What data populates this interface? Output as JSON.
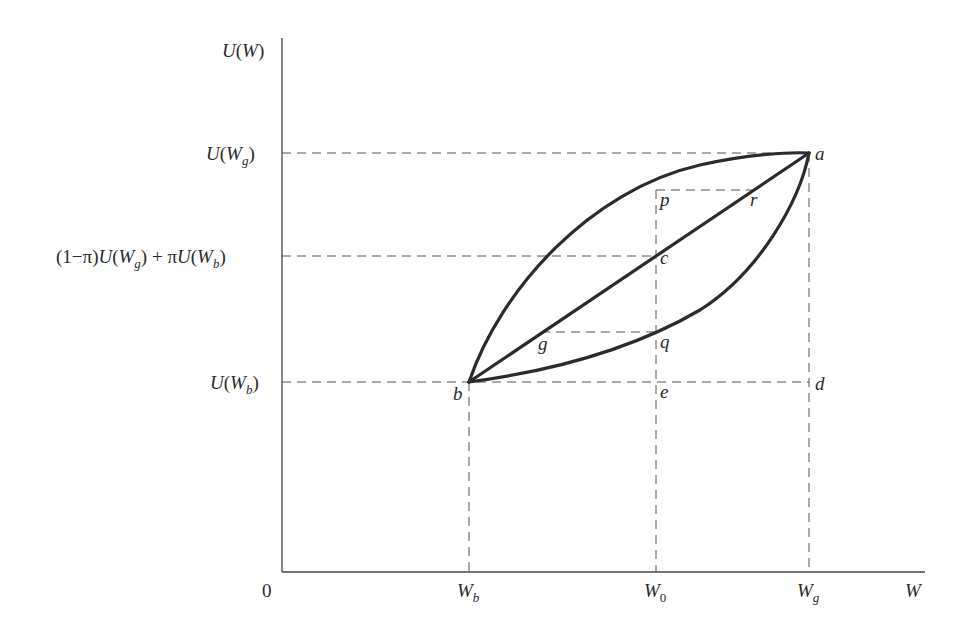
{
  "diagram": {
    "type": "expected-utility-risk-attitudes",
    "y_axis": {
      "label_main": "U",
      "label_arg": "W",
      "ticks": [
        {
          "id": "u_wg",
          "text_main": "U(W",
          "sub": "g",
          "close": ")"
        },
        {
          "id": "expected",
          "prefix": "(1−π)U(W",
          "sub1": "g",
          "mid": ") + πU(W",
          "sub2": "b",
          "close": ")"
        },
        {
          "id": "u_wb",
          "text_main": "U(W",
          "sub": "b",
          "close": ")"
        }
      ]
    },
    "x_axis": {
      "origin": "0",
      "label": "W",
      "ticks": [
        {
          "id": "wb",
          "main": "W",
          "sub": "b"
        },
        {
          "id": "w0",
          "main": "W",
          "sub": "0"
        },
        {
          "id": "wg",
          "main": "W",
          "sub": "g"
        }
      ]
    },
    "points": {
      "a": "a",
      "b": "b",
      "c": "c",
      "d": "d",
      "e": "e",
      "g": "g",
      "p": "p",
      "q": "q",
      "r": "r"
    },
    "curves": [
      {
        "name": "concave-utility",
        "description": "risk-averse utility curve through b, p, a"
      },
      {
        "name": "linear-chord",
        "description": "straight line from b through g, c, r to a"
      },
      {
        "name": "convex-utility",
        "description": "risk-loving utility curve through b, q, a"
      }
    ],
    "colors": {
      "ink": "#2b2b2b",
      "dash": "#555555",
      "background": "#ffffff"
    }
  }
}
